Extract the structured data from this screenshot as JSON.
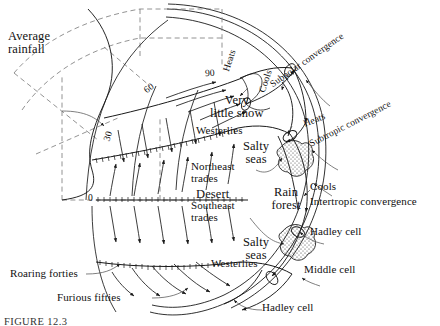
{
  "figure": {
    "caption": "FIGURE 12.3",
    "background_color": "#ffffff",
    "ink_color": "#1a1a1a"
  },
  "annotations": {
    "average_rainfall": "Average\nrainfall",
    "very_little_snow": "Very\nlittle snow",
    "westerlies_north": "Westerlies",
    "northeast_trades": "Northeast\ntrades",
    "southeast_trades": "Southeast\ntrades",
    "westerlies_south": "Westerlies",
    "roaring_forties": "Roaring forties",
    "furious_fifties": "Furious fifties",
    "salty_seas_north": "Salty\nseas",
    "salty_seas_south": "Salty\nseas",
    "desert": "Desert",
    "rain_forest": "Rain\nforest"
  },
  "thermal_labels": {
    "heats_polar": "Heats",
    "cools_subpolar": "Cools",
    "heats_subtropic": "Heats",
    "cools_intertropic": "Cools"
  },
  "convergence_labels": {
    "subpolar": "Subpolar convergence",
    "subtropic": "Subtropic convergence",
    "intertropic": "Intertropic convergence"
  },
  "cell_labels": {
    "hadley_north": "Hadley cell",
    "middle": "Middle cell",
    "hadley_south": "Hadley cell"
  },
  "latitudes": {
    "equator": "0",
    "lat30": "30",
    "lat60": "60",
    "lat90": "90"
  }
}
